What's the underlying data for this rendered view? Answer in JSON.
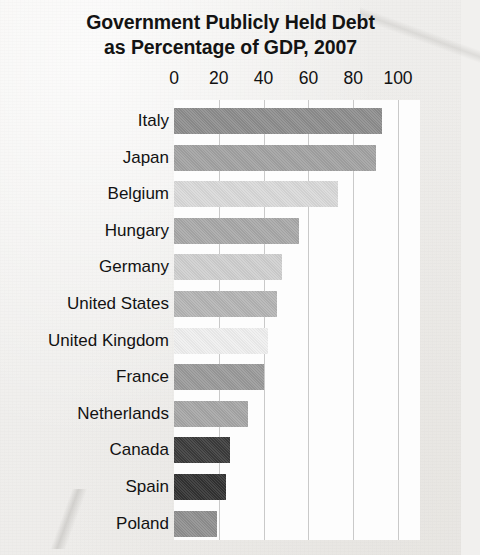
{
  "title": {
    "line1": "Government Publicly Held Debt",
    "line2": "as Percentage of GDP, 2007"
  },
  "chart_data": {
    "type": "bar",
    "orientation": "horizontal",
    "title": "Government Publicly Held Debt as Percentage of GDP, 2007",
    "xlabel": "",
    "ylabel": "",
    "xlim": [
      0,
      100
    ],
    "xticks": [
      0,
      20,
      40,
      60,
      80,
      100
    ],
    "xtick_labels": [
      "0",
      "20",
      "40",
      "60",
      "80",
      "100"
    ],
    "grid": true,
    "legend": "none",
    "categories": [
      "Italy",
      "Japan",
      "Belgium",
      "Hungary",
      "Germany",
      "United States",
      "United Kingdom",
      "France",
      "Netherlands",
      "Canada",
      "Spain",
      "Poland"
    ],
    "values": [
      93,
      90,
      73,
      56,
      48,
      46,
      42,
      40,
      33,
      25,
      23,
      19
    ],
    "bar_colors": [
      "#8d8d8d",
      "#a2a2a2",
      "#d9d9d9",
      "#a8a8a8",
      "#cfcfcf",
      "#b4b4b4",
      "#efefef",
      "#9a9a9a",
      "#a6a6a6",
      "#3b3b3b",
      "#323232",
      "#8f8f8f"
    ]
  },
  "style": {
    "plot_background": "#fdfdfd",
    "gridline_color": "#c9c9c9",
    "page_background": "#f1f0ee",
    "text_color": "#121212"
  }
}
